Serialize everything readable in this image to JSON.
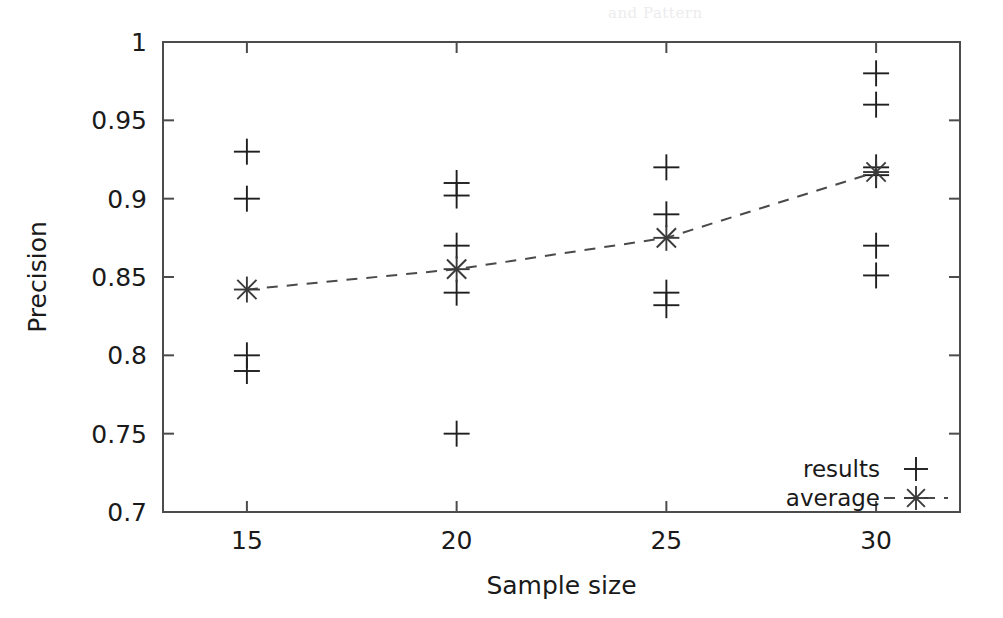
{
  "chart_data": {
    "type": "scatter",
    "title": "",
    "xlabel": "Sample size",
    "ylabel": "Precision",
    "xlim": [
      13,
      32
    ],
    "ylim": [
      0.7,
      1.0
    ],
    "grid": false,
    "legend_position": "bottom-right",
    "x_ticks": [
      "15",
      "20",
      "25",
      "30"
    ],
    "x_tick_values": [
      15,
      20,
      25,
      30
    ],
    "y_ticks": [
      "0.7",
      "0.75",
      "0.8",
      "0.85",
      "0.9",
      "0.95",
      "1"
    ],
    "y_tick_values": [
      0.7,
      0.75,
      0.8,
      0.85,
      0.9,
      0.95,
      1.0
    ],
    "series": [
      {
        "name": "results",
        "marker": "plus",
        "type": "scatter",
        "points": [
          {
            "x": 15,
            "y": 0.93
          },
          {
            "x": 15,
            "y": 0.9
          },
          {
            "x": 15,
            "y": 0.8
          },
          {
            "x": 15,
            "y": 0.79
          },
          {
            "x": 20,
            "y": 0.91
          },
          {
            "x": 20,
            "y": 0.902
          },
          {
            "x": 20,
            "y": 0.87
          },
          {
            "x": 20,
            "y": 0.84
          },
          {
            "x": 20,
            "y": 0.75
          },
          {
            "x": 25,
            "y": 0.92
          },
          {
            "x": 25,
            "y": 0.89
          },
          {
            "x": 25,
            "y": 0.84
          },
          {
            "x": 25,
            "y": 0.832
          },
          {
            "x": 30,
            "y": 0.98
          },
          {
            "x": 30,
            "y": 0.96
          },
          {
            "x": 30,
            "y": 0.92
          },
          {
            "x": 30,
            "y": 0.915
          },
          {
            "x": 30,
            "y": 0.87
          },
          {
            "x": 30,
            "y": 0.851
          }
        ]
      },
      {
        "name": "average",
        "marker": "star",
        "type": "line",
        "linestyle": "dashed",
        "x": [
          15,
          20,
          25,
          30
        ],
        "values": [
          0.842,
          0.855,
          0.875,
          0.917
        ]
      }
    ],
    "legend_entries": [
      {
        "label": "results",
        "marker": "plus",
        "line": false
      },
      {
        "label": "average",
        "marker": "star",
        "line": true
      }
    ],
    "colors": {
      "foreground": "#1a1a1a",
      "axis": "#4c4c4c",
      "marker": "#1f1f1f",
      "line": "#4a4a4a",
      "background": "#ffffff"
    }
  },
  "scan_artifact": {
    "top_text": "and Pattern"
  }
}
